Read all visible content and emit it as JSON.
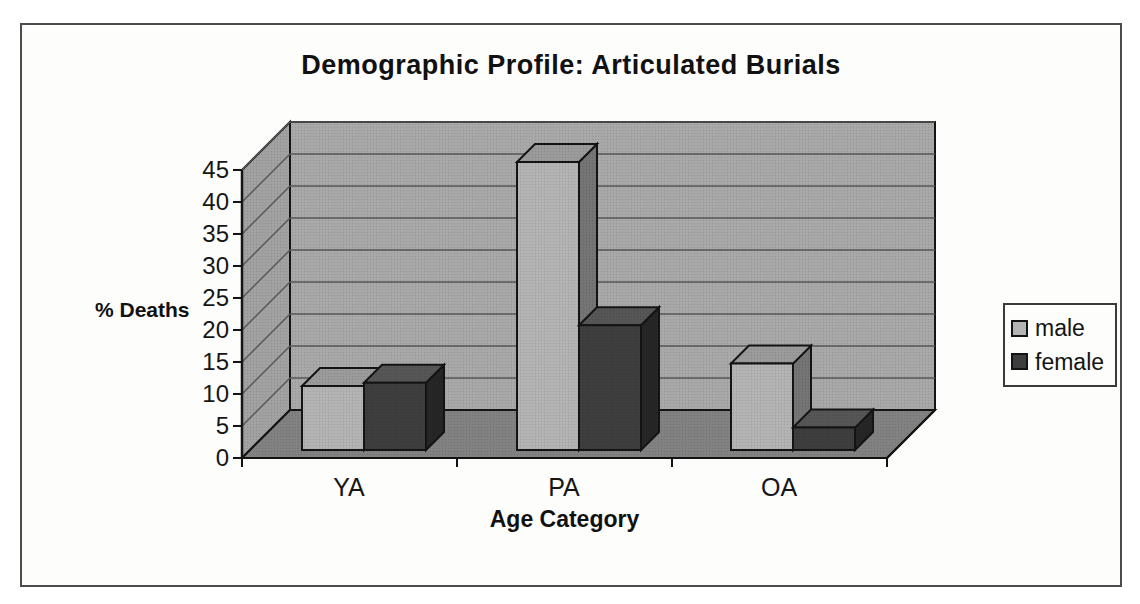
{
  "title_bar": {
    "title": "Demographic Profile: Articulated Burials"
  },
  "chart_data": {
    "type": "bar",
    "variant": "3d-clustered-column",
    "title": "Demographic Profile: Articulated Burials",
    "xlabel": "Age Category",
    "ylabel": "% Deaths",
    "categories": [
      "YA",
      "PA",
      "OA"
    ],
    "series": [
      {
        "name": "male",
        "values": [
          10,
          45,
          13.5
        ],
        "color": "#b4b4b4",
        "top_color": "#9b9b9b",
        "side_color": "#757575"
      },
      {
        "name": "female",
        "values": [
          10.5,
          19.5,
          3.5
        ],
        "color": "#3e3e3e",
        "top_color": "#565656",
        "side_color": "#262626"
      }
    ],
    "ylim": [
      0,
      45
    ],
    "ytick_interval": 5,
    "yticks": [
      0,
      5,
      10,
      15,
      20,
      25,
      30,
      35,
      40,
      45
    ],
    "grid": true,
    "legend_position": "right",
    "colors": {
      "back_wall": "#a9a9a9",
      "side_wall": "#a2a2a2",
      "floor": "#828282",
      "gridline": "#585858",
      "axis_line": "#141414",
      "frame_border": "#4c4c4c",
      "background": "#fdfdfb",
      "text": "#111111"
    }
  },
  "legend": {
    "items": [
      {
        "label": "male"
      },
      {
        "label": "female"
      }
    ]
  }
}
